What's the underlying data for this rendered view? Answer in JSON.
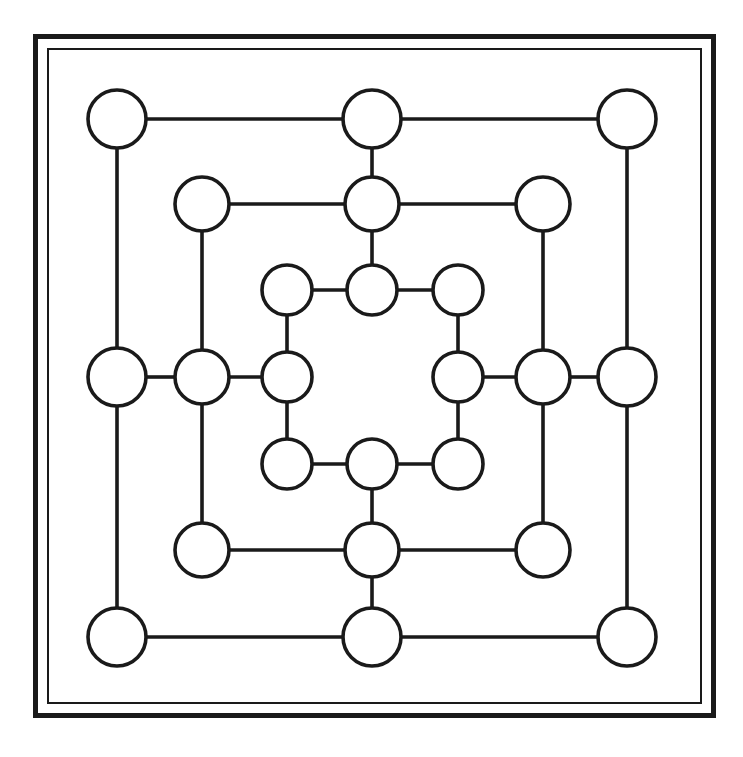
{
  "board": {
    "title": "Nine Men's Morris Board",
    "frame": {
      "outer_border_color": "#1a1a1a",
      "inner_border_color": "#1a1a1a",
      "background_color": "#ffffff",
      "outer_border_width": 5,
      "inner_border_width": 2
    },
    "style": {
      "line_color": "#1a1a1a",
      "node_fill": "#ffffff",
      "node_stroke": "#1a1a1a",
      "line_width": 3.6,
      "node_radius_outer": 29,
      "node_radius_middle": 27,
      "node_radius_inner": 25
    },
    "ring_names": [
      "outer",
      "middle",
      "inner"
    ],
    "point_count": 24,
    "points": [
      {
        "id": "a7",
        "ring": "outer",
        "role": "corner",
        "position": "top-left",
        "x": 117,
        "y": 119,
        "r": 29,
        "occupied": false
      },
      {
        "id": "d7",
        "ring": "outer",
        "role": "midpoint",
        "position": "top-center",
        "x": 372,
        "y": 119,
        "r": 29,
        "occupied": false
      },
      {
        "id": "g7",
        "ring": "outer",
        "role": "corner",
        "position": "top-right",
        "x": 627,
        "y": 119,
        "r": 29,
        "occupied": false
      },
      {
        "id": "a4",
        "ring": "outer",
        "role": "midpoint",
        "position": "middle-left",
        "x": 117,
        "y": 377,
        "r": 29,
        "occupied": false
      },
      {
        "id": "g4",
        "ring": "outer",
        "role": "midpoint",
        "position": "middle-right",
        "x": 627,
        "y": 377,
        "r": 29,
        "occupied": false
      },
      {
        "id": "a1",
        "ring": "outer",
        "role": "corner",
        "position": "bottom-left",
        "x": 117,
        "y": 637,
        "r": 29,
        "occupied": false
      },
      {
        "id": "d1",
        "ring": "outer",
        "role": "midpoint",
        "position": "bottom-center",
        "x": 372,
        "y": 637,
        "r": 29,
        "occupied": false
      },
      {
        "id": "g1",
        "ring": "outer",
        "role": "corner",
        "position": "bottom-right",
        "x": 627,
        "y": 637,
        "r": 29,
        "occupied": false
      },
      {
        "id": "b6",
        "ring": "middle",
        "role": "corner",
        "position": "top-left",
        "x": 202,
        "y": 204,
        "r": 27,
        "occupied": false
      },
      {
        "id": "d6",
        "ring": "middle",
        "role": "midpoint",
        "position": "top-center",
        "x": 372,
        "y": 204,
        "r": 27,
        "occupied": false
      },
      {
        "id": "f6",
        "ring": "middle",
        "role": "corner",
        "position": "top-right",
        "x": 543,
        "y": 204,
        "r": 27,
        "occupied": false
      },
      {
        "id": "b4",
        "ring": "middle",
        "role": "midpoint",
        "position": "middle-left",
        "x": 202,
        "y": 377,
        "r": 27,
        "occupied": false
      },
      {
        "id": "f4",
        "ring": "middle",
        "role": "midpoint",
        "position": "middle-right",
        "x": 543,
        "y": 377,
        "r": 27,
        "occupied": false
      },
      {
        "id": "b2",
        "ring": "middle",
        "role": "corner",
        "position": "bottom-left",
        "x": 202,
        "y": 550,
        "r": 27,
        "occupied": false
      },
      {
        "id": "d2",
        "ring": "middle",
        "role": "midpoint",
        "position": "bottom-center",
        "x": 372,
        "y": 550,
        "r": 27,
        "occupied": false
      },
      {
        "id": "f2",
        "ring": "middle",
        "role": "corner",
        "position": "bottom-right",
        "x": 543,
        "y": 550,
        "r": 27,
        "occupied": false
      },
      {
        "id": "c5",
        "ring": "inner",
        "role": "corner",
        "position": "top-left",
        "x": 287,
        "y": 290,
        "r": 25,
        "occupied": false
      },
      {
        "id": "d5",
        "ring": "inner",
        "role": "midpoint",
        "position": "top-center",
        "x": 372,
        "y": 290,
        "r": 25,
        "occupied": false
      },
      {
        "id": "e5",
        "ring": "inner",
        "role": "corner",
        "position": "top-right",
        "x": 458,
        "y": 290,
        "r": 25,
        "occupied": false
      },
      {
        "id": "c4",
        "ring": "inner",
        "role": "midpoint",
        "position": "middle-left",
        "x": 287,
        "y": 377,
        "r": 25,
        "occupied": false
      },
      {
        "id": "e4",
        "ring": "inner",
        "role": "midpoint",
        "position": "middle-right",
        "x": 458,
        "y": 377,
        "r": 25,
        "occupied": false
      },
      {
        "id": "c3",
        "ring": "inner",
        "role": "corner",
        "position": "bottom-left",
        "x": 287,
        "y": 464,
        "r": 25,
        "occupied": false
      },
      {
        "id": "d3",
        "ring": "inner",
        "role": "midpoint",
        "position": "bottom-center",
        "x": 372,
        "y": 464,
        "r": 25,
        "occupied": false
      },
      {
        "id": "e3",
        "ring": "inner",
        "role": "corner",
        "position": "bottom-right",
        "x": 458,
        "y": 464,
        "r": 25,
        "occupied": false
      }
    ],
    "edges": [
      {
        "from": "a7",
        "to": "d7",
        "orientation": "horizontal"
      },
      {
        "from": "d7",
        "to": "g7",
        "orientation": "horizontal"
      },
      {
        "from": "a4",
        "to": "b4",
        "orientation": "horizontal"
      },
      {
        "from": "b4",
        "to": "c4",
        "orientation": "horizontal"
      },
      {
        "from": "e4",
        "to": "f4",
        "orientation": "horizontal"
      },
      {
        "from": "f4",
        "to": "g4",
        "orientation": "horizontal"
      },
      {
        "from": "a1",
        "to": "d1",
        "orientation": "horizontal"
      },
      {
        "from": "d1",
        "to": "g1",
        "orientation": "horizontal"
      },
      {
        "from": "b6",
        "to": "d6",
        "orientation": "horizontal"
      },
      {
        "from": "d6",
        "to": "f6",
        "orientation": "horizontal"
      },
      {
        "from": "b2",
        "to": "d2",
        "orientation": "horizontal"
      },
      {
        "from": "d2",
        "to": "f2",
        "orientation": "horizontal"
      },
      {
        "from": "c5",
        "to": "d5",
        "orientation": "horizontal"
      },
      {
        "from": "d5",
        "to": "e5",
        "orientation": "horizontal"
      },
      {
        "from": "c3",
        "to": "d3",
        "orientation": "horizontal"
      },
      {
        "from": "d3",
        "to": "e3",
        "orientation": "horizontal"
      },
      {
        "from": "a7",
        "to": "a4",
        "orientation": "vertical"
      },
      {
        "from": "a4",
        "to": "a1",
        "orientation": "vertical"
      },
      {
        "from": "g7",
        "to": "g4",
        "orientation": "vertical"
      },
      {
        "from": "g4",
        "to": "g1",
        "orientation": "vertical"
      },
      {
        "from": "d7",
        "to": "d6",
        "orientation": "vertical"
      },
      {
        "from": "d6",
        "to": "d5",
        "orientation": "vertical"
      },
      {
        "from": "d3",
        "to": "d2",
        "orientation": "vertical"
      },
      {
        "from": "d2",
        "to": "d1",
        "orientation": "vertical"
      },
      {
        "from": "b6",
        "to": "b4",
        "orientation": "vertical"
      },
      {
        "from": "b4",
        "to": "b2",
        "orientation": "vertical"
      },
      {
        "from": "f6",
        "to": "f4",
        "orientation": "vertical"
      },
      {
        "from": "f4",
        "to": "f2",
        "orientation": "vertical"
      },
      {
        "from": "c5",
        "to": "c4",
        "orientation": "vertical"
      },
      {
        "from": "c4",
        "to": "c3",
        "orientation": "vertical"
      },
      {
        "from": "e5",
        "to": "e4",
        "orientation": "vertical"
      },
      {
        "from": "e4",
        "to": "e3",
        "orientation": "vertical"
      }
    ]
  }
}
